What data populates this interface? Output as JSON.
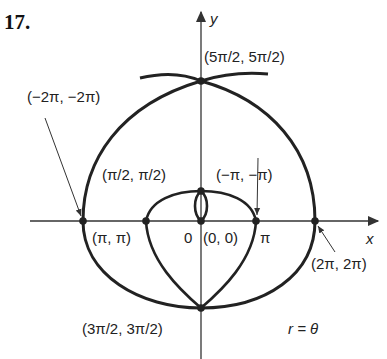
{
  "figure": {
    "number": "17.",
    "equation": "r = θ",
    "axes": {
      "x_label": "x",
      "y_label": "y",
      "origin_label": "0",
      "pi_tick_label": "π"
    },
    "points": [
      {
        "label": "(5π/2, 5π/2)"
      },
      {
        "label": "(−2π, −2π)"
      },
      {
        "label": "(π/2, π/2)"
      },
      {
        "label": "(−π, −π)"
      },
      {
        "label": "(π, π)"
      },
      {
        "label": "(0, 0)"
      },
      {
        "label": "(2π, 2π)"
      },
      {
        "label": "(3π/2, 3π/2)"
      }
    ],
    "colors": {
      "curve": "#222222",
      "axis": "#333333",
      "background": "#ffffff"
    }
  }
}
